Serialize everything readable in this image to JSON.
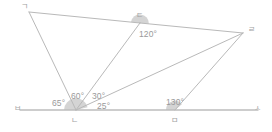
{
  "figure": {
    "stroke_color": "#b9b9b9",
    "baseline_color": "#bdbdbd",
    "sector_color": "#b0b0b0",
    "text_color": "#9a9a9a"
  },
  "vertices": [
    {
      "id": "g",
      "label": "ㄱ",
      "x": 29,
      "y": 12,
      "label_x": 21,
      "label_y": 3
    },
    {
      "id": "d",
      "label": "ㄷ",
      "x": 140,
      "y": 23,
      "label_x": 136,
      "label_y": 12
    },
    {
      "id": "r",
      "label": "ㄹ",
      "x": 243,
      "y": 33,
      "label_x": 248,
      "label_y": 26
    },
    {
      "id": "n",
      "label": "ㄴ",
      "x": 76,
      "y": 110,
      "label_x": 71,
      "label_y": 117
    },
    {
      "id": "m",
      "label": "ㅁ",
      "x": 175,
      "y": 110,
      "label_x": 171,
      "label_y": 117
    }
  ],
  "endpoints": [
    {
      "id": "b",
      "label": "ㅂ",
      "x": 20,
      "y": 110,
      "label_x": 14,
      "label_y": 105
    },
    {
      "id": "s",
      "label": "ㅅ",
      "x": 258,
      "y": 110,
      "label_x": 254,
      "label_y": 105
    }
  ],
  "angles": [
    {
      "id": "angle-d",
      "value": "120°",
      "at": "d",
      "x": 139,
      "y": 30
    },
    {
      "id": "angle-n1",
      "value": "65°",
      "at": "n",
      "x": 52,
      "y": 99
    },
    {
      "id": "angle-n2",
      "value": "60°",
      "at": "n",
      "x": 71,
      "y": 92
    },
    {
      "id": "angle-n3",
      "value": "30°",
      "at": "n",
      "x": 92,
      "y": 92
    },
    {
      "id": "angle-n4",
      "value": "25°",
      "at": "n",
      "x": 97,
      "y": 102
    },
    {
      "id": "angle-m",
      "value": "130°",
      "at": "m",
      "x": 166,
      "y": 98
    }
  ],
  "segments": [
    {
      "id": "seg-g-d",
      "from": "g",
      "to": "d"
    },
    {
      "id": "seg-d-r",
      "from": "d",
      "to": "r"
    },
    {
      "id": "seg-g-n",
      "from": "g",
      "to": "n"
    },
    {
      "id": "seg-d-n",
      "from": "d",
      "to": "n"
    },
    {
      "id": "seg-r-n",
      "from": "r",
      "to": "n"
    },
    {
      "id": "seg-r-m",
      "from": "r",
      "to": "m"
    }
  ],
  "baseline": {
    "id": "baseline-bs",
    "x1": 20,
    "y1": 110,
    "x2": 258,
    "y2": 110
  }
}
